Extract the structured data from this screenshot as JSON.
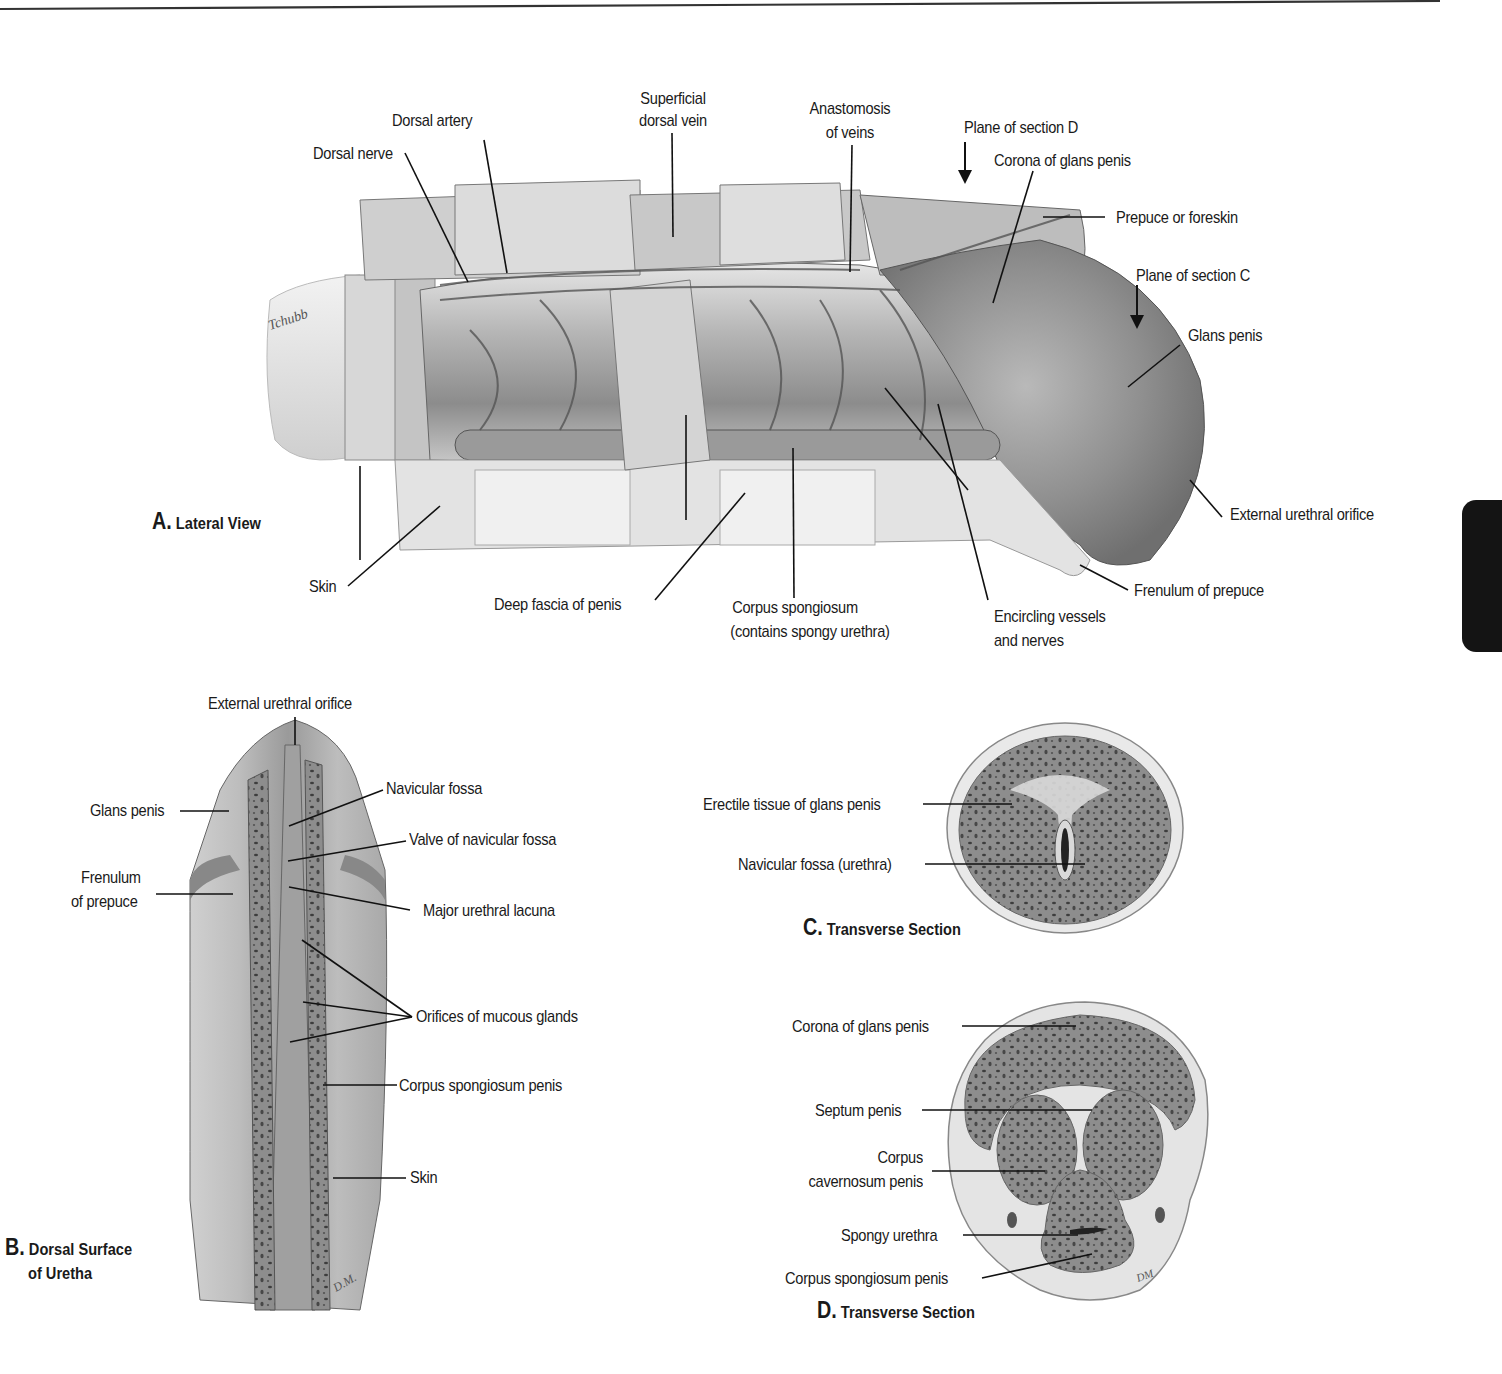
{
  "figure": {
    "panels": {
      "A": {
        "letter": "A.",
        "title": "Lateral View",
        "labels": {
          "dorsal_nerve": "Dorsal nerve",
          "dorsal_artery": "Dorsal artery",
          "superficial_dorsal_vein_1": "Superficial",
          "superficial_dorsal_vein_2": "dorsal vein",
          "anastomosis_1": "Anastomosis",
          "anastomosis_2": "of veins",
          "plane_d": "Plane of section D",
          "corona": "Corona of glans penis",
          "prepuce": "Prepuce or foreskin",
          "plane_c": "Plane of section C",
          "glans": "Glans penis",
          "external_urethral_orifice": "External urethral orifice",
          "frenulum": "Frenulum of prepuce",
          "encircling_1": "Encircling vessels",
          "encircling_2": "and nerves",
          "corpus_spongiosum_1": "Corpus spongiosum",
          "corpus_spongiosum_2": "(contains spongy urethra)",
          "deep_fascia": "Deep fascia of penis",
          "skin": "Skin"
        },
        "signature": "Tchubb"
      },
      "B": {
        "letter": "B.",
        "title_1": "Dorsal Surface",
        "title_2": "of Uretha",
        "labels": {
          "external_urethral_orifice": "External urethral orifice",
          "glans": "Glans penis",
          "frenulum_1": "Frenulum",
          "frenulum_2": "of prepuce",
          "navicular_fossa": "Navicular fossa",
          "valve": "Valve of navicular fossa",
          "lacuna": "Major urethral lacuna",
          "orifices": "Orifices of mucous glands",
          "corpus_spongiosum": "Corpus spongiosum penis",
          "skin": "Skin"
        },
        "signature": "D.M."
      },
      "C": {
        "letter": "C.",
        "title": "Transverse Section",
        "labels": {
          "erectile_tissue": "Erectile tissue of glans penis",
          "navicular_fossa": "Navicular fossa (urethra)"
        }
      },
      "D": {
        "letter": "D.",
        "title": "Transverse Section",
        "labels": {
          "corona": "Corona of glans penis",
          "septum": "Septum penis",
          "corpus_cavernosum_1": "Corpus",
          "corpus_cavernosum_2": "cavernosum penis",
          "spongy_urethra": "Spongy urethra",
          "corpus_spongiosum": "Corpus spongiosum penis"
        },
        "signature": "DM"
      }
    },
    "colors": {
      "ink": "#1a1a1a",
      "tissue_light": "#d9d9d9",
      "tissue_mid": "#a8a8a8",
      "tissue_dark": "#6e6e6e",
      "side_tab": "#141414"
    }
  }
}
